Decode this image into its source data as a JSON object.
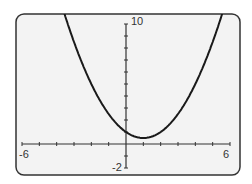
{
  "chart_data": {
    "type": "line",
    "title": "",
    "xlabel": "",
    "ylabel": "",
    "function": "y = 0.5(x - 1)^2 + 0.5",
    "xlim": [
      -6,
      6
    ],
    "ylim": [
      -2,
      10
    ],
    "x_tick_step": 1,
    "y_tick_step": 1,
    "grid": false,
    "tick_labels": {
      "x_min": "-6",
      "x_max": "6",
      "y_min": "-2",
      "y_max": "10"
    },
    "series": [
      {
        "name": "parabola",
        "x": [
          -4,
          -3,
          -2,
          -1,
          0,
          1,
          2,
          3,
          4,
          5,
          6
        ],
        "values": [
          13,
          8.5,
          5,
          2.5,
          1,
          0.5,
          1,
          2.5,
          5,
          8.5,
          13
        ]
      }
    ],
    "colors": {
      "frame_fill": "#f3f3f3",
      "frame_stroke": "#333333",
      "curve": "#1a1a1a",
      "axis": "#333333"
    }
  }
}
